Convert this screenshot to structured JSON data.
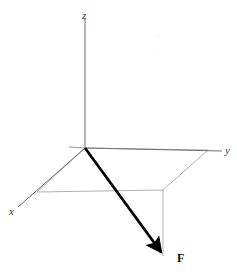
{
  "figure": {
    "kind": "3d-force-vector-diagram",
    "width": 237,
    "height": 279,
    "background_color": "#ffffff"
  },
  "labels": {
    "z_axis": "z",
    "y_axis": "y",
    "x_axis": "x",
    "force_vector": "F"
  },
  "watermarks": {
    "mark_one": "o",
    "mark_two": "x"
  },
  "colors": {
    "axis_line": "#6e6e6e",
    "construction_line": "#a8a8a8",
    "vector_line": "#000000",
    "axis_label_text": "#3a3a3a",
    "vector_label_text": "#111111",
    "watermark_text": "#fbfbfb"
  },
  "geometry": {
    "origin": {
      "x": 85,
      "y": 148
    },
    "z_axis": {
      "x1": 85,
      "y1": 148,
      "x2": 85,
      "y2": 18
    },
    "y_axis": {
      "x1": 85,
      "y1": 148,
      "x2": 222,
      "y2": 151
    },
    "x_axis": {
      "x1": 85,
      "y1": 148,
      "x2": 18,
      "y2": 207
    },
    "y_axis_back_stub": {
      "x1": 85,
      "y1": 148,
      "x2": 69,
      "y2": 147
    },
    "projection_box": [
      {
        "x": 85,
        "y": 148
      },
      {
        "x": 208,
        "y": 150
      },
      {
        "x": 163,
        "y": 190
      },
      {
        "x": 37,
        "y": 192
      }
    ],
    "drop_line": {
      "x1": 163,
      "y1": 190,
      "x2": 163,
      "y2": 256
    },
    "force_vector": {
      "tail": {
        "x": 85,
        "y": 148
      },
      "tip": {
        "x": 166,
        "y": 259
      },
      "stroke_width": 2.8,
      "arrowhead_length": 13,
      "arrowhead_width": 7
    }
  }
}
